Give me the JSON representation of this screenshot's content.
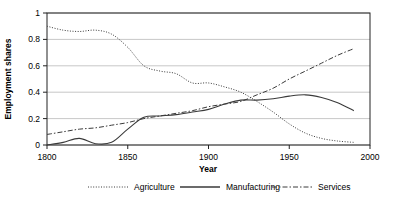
{
  "chart_data": {
    "type": "line",
    "title": "",
    "xlabel": "Year",
    "ylabel": "Employment shares",
    "xlim": [
      1800,
      2000
    ],
    "ylim": [
      0,
      1
    ],
    "xticks": [
      1800,
      1850,
      1900,
      1950,
      2000
    ],
    "xtick_labels": [
      "1800",
      "1850",
      "1900",
      "1950",
      "2000"
    ],
    "yticks": [
      0,
      0.2,
      0.4,
      0.6,
      0.8,
      1
    ],
    "ytick_labels": [
      "0",
      "0.2",
      "0.4",
      "0.6",
      "0.8",
      "1"
    ],
    "grid": "horizontal",
    "legend_position": "bottom",
    "series": [
      {
        "name": "Agriculture",
        "linestyle": "dotted",
        "color": "#3a3a3a",
        "x": [
          1800,
          1810,
          1820,
          1830,
          1840,
          1850,
          1860,
          1870,
          1880,
          1890,
          1900,
          1910,
          1920,
          1930,
          1940,
          1950,
          1960,
          1970,
          1980,
          1990
        ],
        "values": [
          0.9,
          0.87,
          0.86,
          0.87,
          0.84,
          0.74,
          0.6,
          0.56,
          0.54,
          0.47,
          0.47,
          0.44,
          0.4,
          0.33,
          0.25,
          0.16,
          0.09,
          0.05,
          0.03,
          0.02
        ]
      },
      {
        "name": "Manufacturing",
        "linestyle": "solid",
        "color": "#3a3a3a",
        "x": [
          1800,
          1810,
          1820,
          1830,
          1840,
          1850,
          1860,
          1870,
          1880,
          1890,
          1900,
          1910,
          1920,
          1930,
          1940,
          1950,
          1960,
          1970,
          1980,
          1990
        ],
        "values": [
          0.0,
          0.02,
          0.05,
          0.01,
          0.02,
          0.12,
          0.21,
          0.22,
          0.23,
          0.25,
          0.27,
          0.31,
          0.34,
          0.34,
          0.35,
          0.37,
          0.38,
          0.36,
          0.32,
          0.26
        ]
      },
      {
        "name": "Services",
        "linestyle": "dashdot",
        "color": "#3a3a3a",
        "x": [
          1800,
          1810,
          1820,
          1830,
          1840,
          1850,
          1860,
          1870,
          1880,
          1890,
          1900,
          1910,
          1920,
          1930,
          1940,
          1950,
          1960,
          1970,
          1980,
          1990
        ],
        "values": [
          0.08,
          0.1,
          0.12,
          0.13,
          0.15,
          0.17,
          0.2,
          0.22,
          0.24,
          0.26,
          0.29,
          0.31,
          0.33,
          0.38,
          0.43,
          0.5,
          0.56,
          0.62,
          0.68,
          0.73
        ]
      }
    ],
    "legend": [
      "Agriculture",
      "Manufacturing",
      "Services"
    ]
  }
}
